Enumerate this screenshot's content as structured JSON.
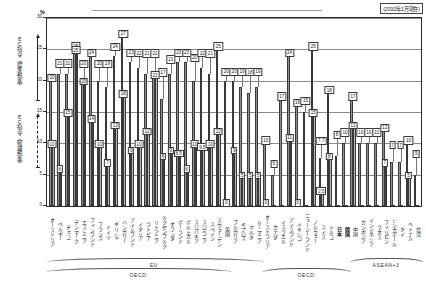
{
  "header": {
    "as_of": "(2010年1月現在)",
    "unit_label": "%"
  },
  "y_axis": {
    "ticks": [
      "30",
      "25",
      "20",
      "15",
      "10",
      "5",
      "0"
    ]
  },
  "annotations": {
    "ec_standard": "ＥＣ指令（標準税率）",
    "ec_reduced": "ＥＣ指令（軽減税率）",
    "group_eu": "EU",
    "group_oecd_left": "OECD",
    "group_oecd_right": "OECD",
    "group_asean": "ASEAN+3"
  },
  "chart_data": {
    "type": "bar",
    "title": "",
    "xlabel": "",
    "ylabel": "%",
    "ylim": [
      0,
      30
    ],
    "grid": true,
    "series": [
      {
        "name": "標準税率"
      },
      {
        "name": "軽減税率"
      }
    ],
    "categories": [
      "オーストリア",
      "ベルギー",
      "チェコ",
      "デンマーク",
      "エストニア",
      "フィンランド",
      "フランス",
      "ドイツ",
      "ギリシャ",
      "ハンガリー",
      "アイルランド",
      "イタリア",
      "ラトビア",
      "リトアニア",
      "ルクセンブルク",
      "オランダ",
      "ポーランド",
      "ポルトガル",
      "スロバキア",
      "スロベニア",
      "スペイン",
      "スウェーデン",
      "英国",
      "ブルガリア",
      "キプロス",
      "マルタ",
      "ルーマニア",
      "オーストラリア",
      "カナダ",
      "イスラエル",
      "アイスランド",
      "メキシコ",
      "ニュージーランド",
      "ノルウェー",
      "スイス",
      "トルコ",
      "日本",
      "韓国",
      "中国",
      "カンボジア",
      "インドネシア",
      "ラオス",
      "フィリピン",
      "シンガポール",
      "タイ",
      "ベトナム",
      "台湾"
    ],
    "standard_values": [
      20,
      21,
      21,
      25,
      20,
      24,
      20,
      19,
      24,
      27,
      23,
      22,
      21,
      21,
      17,
      21,
      23,
      23,
      20,
      22,
      21,
      25,
      20,
      20,
      19,
      18,
      19,
      10,
      5,
      17,
      24,
      16,
      15,
      25,
      7.7,
      18,
      8,
      10,
      17,
      10,
      10,
      10,
      12,
      7,
      7,
      10,
      5
    ],
    "standard_labels": [
      "20",
      "21",
      "21",
      "25",
      "20",
      "24",
      "20",
      "19",
      "24",
      "27",
      "23",
      "22",
      "21",
      "21",
      "17",
      "21",
      "23",
      "23",
      "20",
      "22",
      "21",
      "25",
      "20",
      "20",
      "19",
      "18",
      "19",
      "10",
      "5",
      "17",
      "24",
      "16",
      "15",
      "25",
      "7.7",
      "18",
      "8",
      "10",
      "17",
      "10",
      "10",
      "10",
      "12",
      "7",
      "7",
      "10",
      "5"
    ],
    "reduced_values": [
      10,
      6,
      15,
      25,
      20,
      14,
      10,
      7,
      13,
      18,
      9,
      10,
      12,
      21,
      8,
      9,
      8.5,
      6,
      10,
      9.5,
      10,
      12,
      0,
      9,
      5,
      5,
      5,
      0,
      0,
      0,
      11,
      0,
      0,
      15,
      2.5,
      8,
      0,
      0,
      13,
      0,
      0,
      0,
      7,
      0,
      0,
      5,
      0
    ],
    "reduced_labels": [
      "10",
      "6",
      "15",
      "25",
      "20",
      "14",
      "10",
      "7",
      "13",
      "18",
      "9",
      "10",
      "12",
      "21",
      "8",
      "9",
      "8,5",
      "6",
      "10",
      "9,5",
      "10",
      "12",
      "0",
      "9",
      "5",
      "5",
      "5",
      "0",
      "",
      "",
      "11",
      "0",
      "",
      "15",
      "2,5",
      "8",
      "",
      "",
      "13",
      "",
      "",
      "",
      "7",
      "",
      "",
      "5",
      ""
    ],
    "bold_categories": [
      "日本",
      "韓国"
    ],
    "groups": [
      {
        "label": "EU",
        "start": 0,
        "end": 26
      },
      {
        "label": "OECD",
        "start": 0,
        "end": 22
      },
      {
        "label": "OECD",
        "start": 27,
        "end": 37
      },
      {
        "label": "ASEAN+3",
        "start": 38,
        "end": 46
      }
    ]
  }
}
